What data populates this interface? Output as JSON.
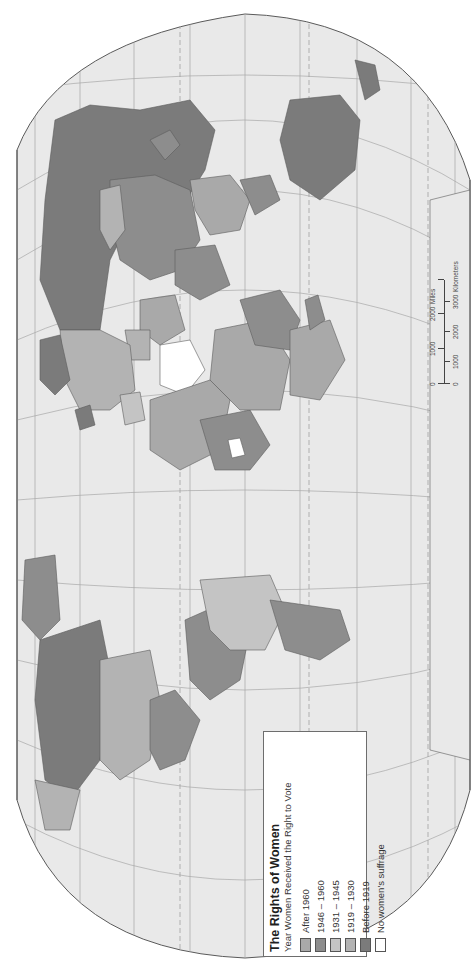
{
  "map": {
    "title": "The Rights of Women",
    "subtitle": "Year Women Received the Right to Vote",
    "orientation": "rotated 90° counter-clockwise (north to the left)",
    "colors": {
      "ocean": "#e9e9e9",
      "graticule": "#9a9a9a",
      "outline": "#5a5a5a",
      "page": "#ffffff"
    }
  },
  "legend": {
    "title": "The Rights of Women",
    "subtitle": "Year Women Received the Right to Vote",
    "items": [
      {
        "label": "After 1960",
        "color": "#a9a9a9"
      },
      {
        "label": "1946 – 1960",
        "color": "#8d8d8d"
      },
      {
        "label": "1931 – 1945",
        "color": "#c4c4c4"
      },
      {
        "label": "1919 – 1930",
        "color": "#b3b3b3"
      },
      {
        "label": "Before 1919",
        "color": "#7b7b7b"
      },
      {
        "label": "No women's suffrage",
        "color": "#ffffff"
      }
    ]
  },
  "scale_bar": {
    "miles_label": "Miles",
    "km_label": "Kilometers",
    "miles_ticks": [
      "0",
      "1000",
      "2000"
    ],
    "km_ticks": [
      "0",
      "1000",
      "2000",
      "3000"
    ]
  }
}
